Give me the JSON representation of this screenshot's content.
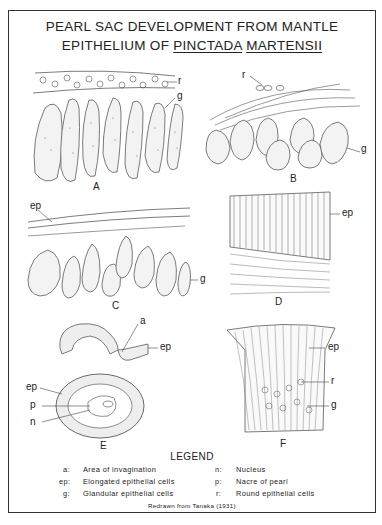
{
  "title": {
    "line1": "PEARL SAC DEVELOPMENT FROM MANTLE",
    "line2_prefix": "EPITHELIUM OF ",
    "line2_genus": "PINCTADA",
    "line2_species": "MARTENSII"
  },
  "panels": [
    {
      "id": "A",
      "letter": "A",
      "labels": [
        "r",
        "g"
      ]
    },
    {
      "id": "B",
      "letter": "B",
      "labels": [
        "r",
        "g"
      ]
    },
    {
      "id": "C",
      "letter": "C",
      "labels": [
        "ep",
        "g"
      ]
    },
    {
      "id": "D",
      "letter": "D",
      "labels": [
        "ep"
      ]
    },
    {
      "id": "E",
      "letter": "E",
      "labels": [
        "a",
        "ep",
        "ep",
        "p",
        "n"
      ]
    },
    {
      "id": "F",
      "letter": "F",
      "labels": [
        "ep",
        "r",
        "g"
      ]
    }
  ],
  "legend": {
    "title": "LEGEND",
    "items": [
      {
        "key": "a:",
        "desc": "Area of invagination"
      },
      {
        "key": "ep:",
        "desc": "Elongated epithelial cells"
      },
      {
        "key": "g:",
        "desc": "Glandular epithelial cells"
      },
      {
        "key": "n:",
        "desc": "Nucleus"
      },
      {
        "key": "p:",
        "desc": "Nacre of pearl"
      },
      {
        "key": "r:",
        "desc": "Round epithelial cells"
      }
    ]
  },
  "credit": "Redrawn from Tanaka (1931)"
}
